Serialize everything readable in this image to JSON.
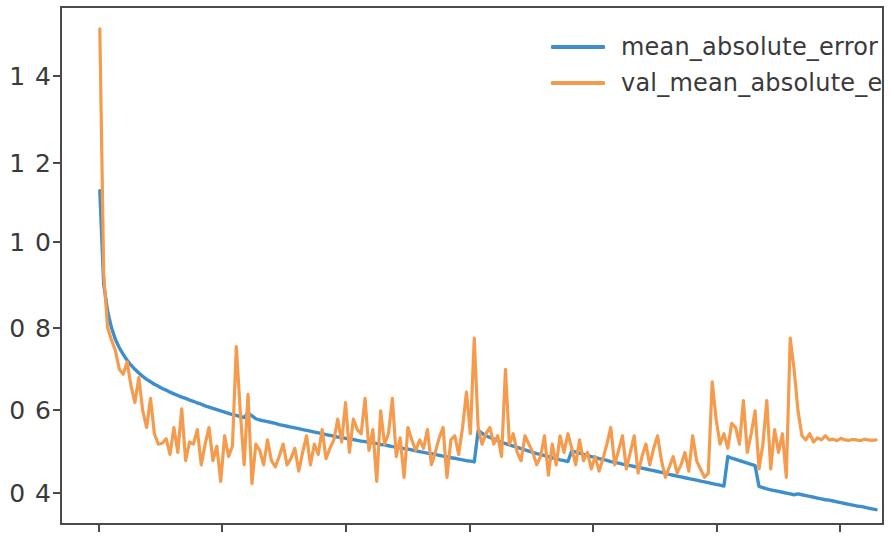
{
  "chart_data": {
    "type": "line",
    "title": "",
    "xlabel": "",
    "ylabel": "",
    "xlim": [
      0,
      200
    ],
    "ylim": [
      0.33,
      1.57
    ],
    "grid": false,
    "legend_position": "upper right",
    "ytick_labels": [
      "0.4",
      "0.6",
      "0.8",
      "1.0",
      "1.2",
      "1.4"
    ],
    "ytick_values": [
      0.4,
      0.6,
      0.8,
      1.0,
      1.2,
      1.4
    ],
    "xtick_labels": [
      "",
      "",
      "",
      "",
      "",
      "",
      ""
    ],
    "colors": {
      "mean_absolute_error": "#3e8ecc",
      "val_mean_absolute_error": "#f59b4e",
      "axis": "#4a4a4a",
      "text": "#3a3a3a",
      "background": "#ffffff"
    },
    "series": [
      {
        "name": "mean_absolute_error",
        "color": "#3e8ecc",
        "values": [
          1.13,
          0.905,
          0.84,
          0.8,
          0.772,
          0.752,
          0.736,
          0.722,
          0.71,
          0.7,
          0.691,
          0.683,
          0.676,
          0.67,
          0.664,
          0.659,
          0.654,
          0.65,
          0.645,
          0.641,
          0.637,
          0.633,
          0.63,
          0.626,
          0.623,
          0.619,
          0.616,
          0.612,
          0.609,
          0.606,
          0.603,
          0.6,
          0.597,
          0.594,
          0.591,
          0.589,
          0.586,
          0.584,
          0.595,
          0.588,
          0.581,
          0.578,
          0.576,
          0.574,
          0.572,
          0.57,
          0.567,
          0.565,
          0.563,
          0.561,
          0.559,
          0.557,
          0.555,
          0.553,
          0.551,
          0.549,
          0.547,
          0.545,
          0.543,
          0.541,
          0.539,
          0.537,
          0.536,
          0.534,
          0.532,
          0.531,
          0.529,
          0.527,
          0.526,
          0.524,
          0.523,
          0.521,
          0.519,
          0.518,
          0.516,
          0.514,
          0.513,
          0.511,
          0.509,
          0.508,
          0.506,
          0.504,
          0.502,
          0.5,
          0.498,
          0.497,
          0.495,
          0.493,
          0.491,
          0.489,
          0.487,
          0.486,
          0.484,
          0.482,
          0.48,
          0.479,
          0.477,
          0.553,
          0.546,
          0.54,
          0.536,
          0.532,
          0.528,
          0.525,
          0.521,
          0.518,
          0.515,
          0.512,
          0.509,
          0.506,
          0.503,
          0.5,
          0.497,
          0.495,
          0.492,
          0.49,
          0.487,
          0.485,
          0.482,
          0.48,
          0.478,
          0.504,
          0.501,
          0.498,
          0.495,
          0.493,
          0.49,
          0.488,
          0.485,
          0.483,
          0.481,
          0.478,
          0.476,
          0.474,
          0.472,
          0.47,
          0.468,
          0.466,
          0.464,
          0.462,
          0.46,
          0.458,
          0.456,
          0.454,
          0.452,
          0.45,
          0.447,
          0.445,
          0.443,
          0.441,
          0.439,
          0.437,
          0.435,
          0.433,
          0.431,
          0.429,
          0.427,
          0.425,
          0.423,
          0.421,
          0.419,
          0.49,
          0.486,
          0.483,
          0.48,
          0.477,
          0.474,
          0.471,
          0.468,
          0.418,
          0.415,
          0.412,
          0.41,
          0.408,
          0.406,
          0.404,
          0.402,
          0.4,
          0.398,
          0.4,
          0.398,
          0.396,
          0.394,
          0.392,
          0.39,
          0.388,
          0.386,
          0.385,
          0.383,
          0.381,
          0.379,
          0.377,
          0.375,
          0.373,
          0.371,
          0.37,
          0.368,
          0.366,
          0.364,
          0.362
        ]
      },
      {
        "name": "val_mean_absolute_error",
        "color": "#f59b4e",
        "values": [
          1.52,
          0.93,
          0.8,
          0.77,
          0.745,
          0.7,
          0.688,
          0.718,
          0.66,
          0.62,
          0.68,
          0.6,
          0.56,
          0.63,
          0.545,
          0.52,
          0.522,
          0.533,
          0.495,
          0.56,
          0.5,
          0.605,
          0.48,
          0.525,
          0.52,
          0.555,
          0.47,
          0.52,
          0.56,
          0.48,
          0.515,
          0.43,
          0.54,
          0.49,
          0.515,
          0.755,
          0.6,
          0.47,
          0.64,
          0.425,
          0.52,
          0.505,
          0.47,
          0.53,
          0.48,
          0.465,
          0.49,
          0.52,
          0.47,
          0.485,
          0.51,
          0.455,
          0.5,
          0.54,
          0.47,
          0.52,
          0.495,
          0.555,
          0.485,
          0.51,
          0.53,
          0.58,
          0.525,
          0.62,
          0.5,
          0.58,
          0.555,
          0.545,
          0.63,
          0.505,
          0.555,
          0.43,
          0.6,
          0.52,
          0.545,
          0.63,
          0.49,
          0.535,
          0.44,
          0.56,
          0.53,
          0.505,
          0.53,
          0.51,
          0.555,
          0.47,
          0.5,
          0.535,
          0.56,
          0.44,
          0.53,
          0.54,
          0.495,
          0.56,
          0.645,
          0.545,
          0.775,
          0.56,
          0.52,
          0.545,
          0.56,
          0.52,
          0.54,
          0.49,
          0.7,
          0.52,
          0.545,
          0.5,
          0.48,
          0.54,
          0.52,
          0.5,
          0.47,
          0.49,
          0.54,
          0.445,
          0.52,
          0.47,
          0.54,
          0.5,
          0.545,
          0.51,
          0.47,
          0.53,
          0.48,
          0.5,
          0.46,
          0.49,
          0.455,
          0.485,
          0.52,
          0.56,
          0.47,
          0.505,
          0.54,
          0.46,
          0.5,
          0.54,
          0.45,
          0.49,
          0.52,
          0.47,
          0.51,
          0.54,
          0.48,
          0.44,
          0.465,
          0.49,
          0.45,
          0.47,
          0.5,
          0.455,
          0.54,
          0.48,
          0.46,
          0.44,
          0.45,
          0.67,
          0.58,
          0.52,
          0.545,
          0.51,
          0.57,
          0.56,
          0.52,
          0.625,
          0.5,
          0.545,
          0.6,
          0.46,
          0.52,
          0.625,
          0.46,
          0.555,
          0.5,
          0.545,
          0.44,
          0.775,
          0.7,
          0.6,
          0.54,
          0.53,
          0.545,
          0.525,
          0.535,
          0.53,
          0.54,
          0.53,
          0.532,
          0.528,
          0.534,
          0.53,
          0.529,
          0.531,
          0.53,
          0.528,
          0.532,
          0.53,
          0.529,
          0.53
        ]
      }
    ]
  },
  "legend": {
    "entries": [
      {
        "label": "mean_absolute_error",
        "color": "#3e8ecc"
      },
      {
        "label": "val_mean_absolute_error",
        "color": "#f59b4e"
      }
    ]
  },
  "axes": {
    "ytick_labels": [
      "1 4",
      "1 2",
      "1 0",
      "0 8",
      "0 6",
      "0 4"
    ]
  }
}
